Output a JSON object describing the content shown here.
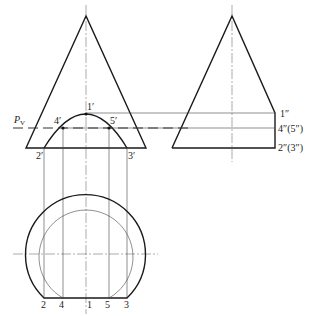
{
  "plane_label": "P",
  "plane_subscript": "V",
  "front_view": {
    "points": [
      {
        "id": "1",
        "label": "1′"
      },
      {
        "id": "2",
        "label": "2′"
      },
      {
        "id": "3",
        "label": "3′"
      },
      {
        "id": "4",
        "label": "4′"
      },
      {
        "id": "5",
        "label": "5′"
      }
    ]
  },
  "side_view": {
    "labels": [
      {
        "id": "1",
        "label": "1″"
      },
      {
        "id": "45",
        "label": "4″(5″)"
      },
      {
        "id": "23",
        "label": "2″(3″)"
      }
    ]
  },
  "top_view": {
    "labels": [
      {
        "id": "2",
        "label": "2"
      },
      {
        "id": "4",
        "label": "4"
      },
      {
        "id": "1",
        "label": "1"
      },
      {
        "id": "5",
        "label": "5"
      },
      {
        "id": "3",
        "label": "3"
      }
    ]
  },
  "colors": {
    "line": "#1a1a1a",
    "background": "#ffffff"
  }
}
